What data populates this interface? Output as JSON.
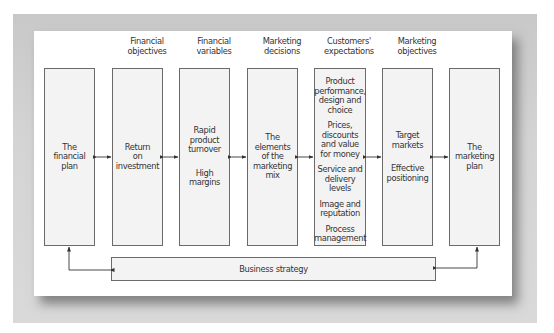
{
  "diagram": {
    "columns": [
      {
        "header": [],
        "items": [
          [
            "The",
            "financial",
            "plan"
          ]
        ]
      },
      {
        "header": [
          "Financial",
          "objectives"
        ],
        "items": [
          [
            "Return",
            "on",
            "investment"
          ]
        ]
      },
      {
        "header": [
          "Financial",
          "variables"
        ],
        "items": [
          [
            "Rapid",
            "product",
            "turnover"
          ],
          [
            "High",
            "margins"
          ]
        ]
      },
      {
        "header": [
          "Marketing",
          "decisions"
        ],
        "items": [
          [
            "The",
            "elements",
            "of the",
            "marketing",
            "mix"
          ]
        ]
      },
      {
        "header": [
          "Customers'",
          "expectations"
        ],
        "items": [
          [
            "Product",
            "performance,",
            "design and",
            "choice"
          ],
          [
            "Prices,",
            "discounts",
            "and value",
            "for money"
          ],
          [
            "Service and",
            "delivery",
            "levels"
          ],
          [
            "Image and",
            "reputation"
          ],
          [
            "Process",
            "management"
          ]
        ]
      },
      {
        "header": [
          "Marketing",
          "objectives"
        ],
        "items": [
          [
            "Target",
            "markets"
          ],
          [
            "Effective",
            "positioning"
          ]
        ]
      },
      {
        "header": [],
        "items": [
          [
            "The",
            "marketing",
            "plan"
          ]
        ]
      }
    ],
    "bottom_bar": {
      "label": "Business strategy"
    },
    "connectors": {
      "between_columns": "double-headed arrows",
      "bottom": "arrows from financial plan and marketing plan to business strategy"
    }
  }
}
